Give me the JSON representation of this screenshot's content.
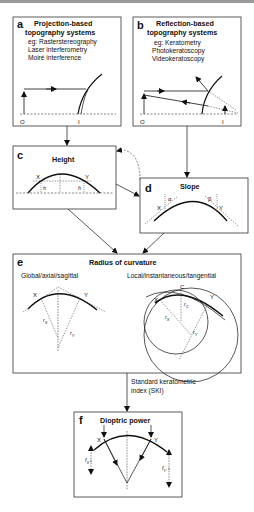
{
  "panels": {
    "a": {
      "letter": "a",
      "title_line1": "Projection-based",
      "title_line2": "topography systems",
      "examples": [
        "eg: Rasterstereography",
        "Laser interferometry",
        "Moiré interference"
      ],
      "axis_left": "O",
      "axis_right": "I"
    },
    "b": {
      "letter": "b",
      "title_line1": "Reflection-based",
      "title_line2": "topography systems",
      "examples": [
        "eg: Keratometry",
        "Photokeratoscopy",
        "Videokeratoscopy"
      ],
      "axis_left": "O",
      "axis_right": "I"
    },
    "c": {
      "letter": "c",
      "title": "Height",
      "point_x": "X",
      "point_y": "Y",
      "h_left": "h",
      "h_right": "h"
    },
    "d": {
      "letter": "d",
      "title": "Slope",
      "point_x": "X",
      "point_y": "Y",
      "alpha": "α",
      "beta": "β"
    },
    "e": {
      "letter": "e",
      "title": "Radius of curvature",
      "left_subtitle": "Global/axial/sagittal",
      "right_subtitle": "Local/instantaneous/tangential",
      "point_x": "X",
      "point_y": "Y",
      "point_c": "C",
      "r_x": "r",
      "r_x_sub": "X",
      "r_y": "r",
      "r_y_sub": "Y",
      "r_c": "r",
      "r_c_sub": "C"
    },
    "f": {
      "letter": "f",
      "title": "Dioptric power",
      "point_x": "X",
      "point_y": "Y",
      "f_x": "f",
      "f_x_sub": "X",
      "f_y": "f",
      "f_y_sub": "Y"
    }
  },
  "connector_label_line1": "Standard keratometric",
  "connector_label_line2": "index (SKI)"
}
